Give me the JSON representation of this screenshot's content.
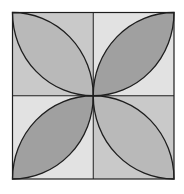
{
  "diagram": {
    "type": "geometric-pattern",
    "square": {
      "x": 12.5,
      "y": 12.5,
      "width": 161.5,
      "height": 166.5
    },
    "center": {
      "x": 93.25,
      "y": 95.75
    },
    "stroke_color": "#1e1e1e",
    "quadrants": [
      {
        "id": "top-left",
        "background": "#c9c9c9",
        "petal_fill": "#b9b9b9",
        "petal_direction": "top-left to center"
      },
      {
        "id": "top-right",
        "background": "#e2e2e2",
        "petal_fill": "#a0a0a0",
        "petal_direction": "top-right to center"
      },
      {
        "id": "bottom-left",
        "background": "#e2e2e2",
        "petal_fill": "#a0a0a0",
        "petal_direction": "bottom-left to center"
      },
      {
        "id": "bottom-right",
        "background": "#c9c9c9",
        "petal_fill": "#b9b9b9",
        "petal_direction": "bottom-right to center"
      }
    ]
  }
}
